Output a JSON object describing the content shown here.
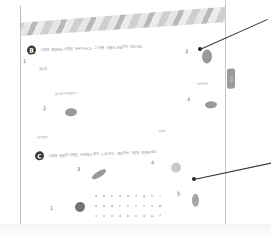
{
  "worksheet": {
    "section_b": {
      "badge": "B",
      "instruction": "그림에 해당하는 낱말을 바르게 쓰고, 그 곤충 이름이 무엇인지 적으세요."
    },
    "section_c": {
      "badge": "C",
      "instruction": "그림에 알맞은 낱말을 아래에서 찾아 ○표 하고, 해당하는 그림과 연결하세요."
    },
    "numbers_b": [
      "1",
      "2",
      "3",
      "4"
    ],
    "labels_b": [
      "grasshopper",
      "spider",
      "ant",
      "beetle",
      "bee"
    ],
    "numbers_c": [
      "1",
      "2",
      "3",
      "4",
      "5"
    ],
    "side_tab": "정답",
    "grid_rows": [
      [
        "a",
        "b",
        "c",
        "d",
        "e",
        "f",
        "g",
        "h",
        "i"
      ],
      [
        "o",
        "p",
        "q",
        "r",
        "s",
        "t",
        "u",
        "v",
        "w"
      ],
      [
        "x",
        "y",
        "z",
        "a",
        "b",
        "c",
        "d",
        "e",
        "f"
      ],
      [
        "g",
        "h",
        "i",
        "j",
        "k",
        "l",
        "m",
        "n",
        "o"
      ],
      [
        "p",
        "q",
        "r",
        "s",
        "t",
        "u",
        "v",
        "w",
        "x"
      ]
    ]
  }
}
